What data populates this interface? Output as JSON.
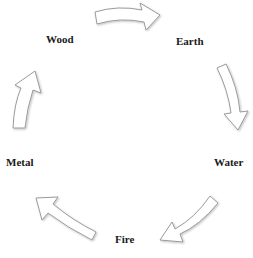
{
  "diagram": {
    "nodes": [
      {
        "id": "wood",
        "label": "Wood"
      },
      {
        "id": "earth",
        "label": "Earth"
      },
      {
        "id": "water",
        "label": "Water"
      },
      {
        "id": "fire",
        "label": "Fire"
      },
      {
        "id": "metal",
        "label": "Metal"
      }
    ],
    "edges": [
      {
        "from": "wood",
        "to": "earth"
      },
      {
        "from": "earth",
        "to": "water"
      },
      {
        "from": "water",
        "to": "fire"
      },
      {
        "from": "fire",
        "to": "metal"
      },
      {
        "from": "metal",
        "to": "wood"
      }
    ],
    "colors": {
      "arrow_fill": "#ffffff",
      "arrow_stroke": "#9a9a9a",
      "text": "#1a1a1a"
    }
  }
}
